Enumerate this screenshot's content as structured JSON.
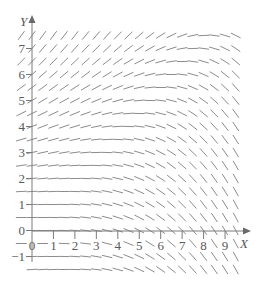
{
  "figure": {
    "x_axis_label": "X",
    "y_axis_label": "Y"
  },
  "colors": {
    "segment": "#8c8c8c",
    "axis": "#7a7a7a",
    "text": "#5a5a5a",
    "background": "#ffffff"
  },
  "chart_data": {
    "type": "slope_field",
    "title": "",
    "xlabel": "X",
    "ylabel": "Y",
    "x_ticks": [
      0,
      1,
      2,
      3,
      4,
      5,
      6,
      7,
      8,
      9
    ],
    "x_tick_labels": [
      "0",
      "1",
      "2",
      "3",
      "4",
      "5",
      "6",
      "7",
      "8",
      "9"
    ],
    "y_ticks": [
      -1,
      0,
      1,
      2,
      3,
      4,
      5,
      6,
      7
    ],
    "y_tick_labels": [
      "−1",
      "0",
      "1",
      "2",
      "3",
      "4",
      "5",
      "6",
      "7"
    ],
    "xlim": [
      -0.5,
      9.5
    ],
    "ylim": [
      -1.5,
      7.5
    ],
    "grid_on": false,
    "legend": null,
    "sample_grid": {
      "x_start": -0.5,
      "x_end": 9.5,
      "y_start": -1.5,
      "y_end": 7.5,
      "step": 0.5
    },
    "slope_function": {
      "form": "dy/dx = a*y^2 - b*x^2",
      "a": 0.02,
      "b": 0.017,
      "description": "Slopes near zero along y≈x; positive and steep for large y at small x; negative and steep for large x at small y"
    }
  }
}
